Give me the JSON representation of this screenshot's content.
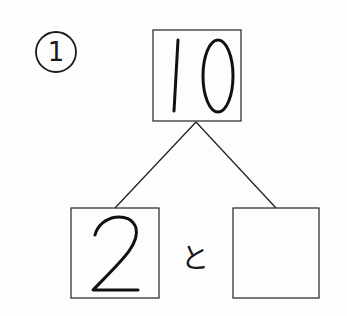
{
  "problem": {
    "number_label": "1",
    "whole": "10",
    "parts": [
      "2",
      ""
    ],
    "connector": "と"
  },
  "colors": {
    "ink": "#1a1a1a",
    "background": "#fdfdfd"
  }
}
